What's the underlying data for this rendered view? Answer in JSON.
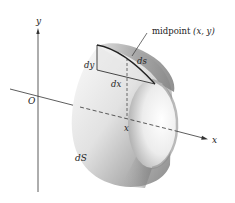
{
  "figure": {
    "type": "surface-of-revolution-element",
    "axes": {
      "y_label": "y",
      "x_label": "x",
      "origin_label": "O"
    },
    "annotations": {
      "midpoint_prefix": "midpoint ",
      "midpoint_coords": "(x, y)",
      "dy": "dy",
      "dx": "dx",
      "ds": "ds",
      "x_tick": "x",
      "surface_element": "dS"
    },
    "colors": {
      "axis": "#333333",
      "surface_light": "#f2f2f2",
      "surface_dark": "#7a7a7a",
      "inner_light": "#fafafa",
      "inner_dark": "#9a9a9a",
      "triangle_line": "#333333",
      "ds_curve": "#222222"
    }
  }
}
